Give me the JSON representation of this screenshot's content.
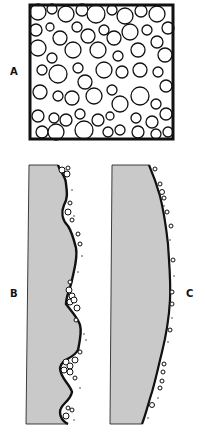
{
  "figure": {
    "panels": [
      {
        "id": "A",
        "label": "A",
        "description": "Square box packed with bubbles of varying size"
      },
      {
        "id": "B",
        "label": "B",
        "description": "Gray column with irregular, scalloped right boundary lined with bubbles"
      },
      {
        "id": "C",
        "label": "C",
        "description": "Gray column with smooth, slightly convex right boundary with sparse small bubbles"
      }
    ],
    "colors": {
      "fill": "#c9c9c9",
      "stroke": "#111111",
      "background": "#ffffff"
    }
  }
}
